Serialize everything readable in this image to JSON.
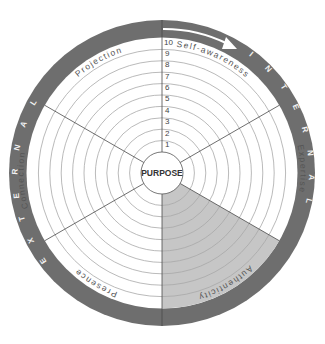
{
  "diagram": {
    "center_label": "PURPOSE",
    "scale": [
      "1",
      "2",
      "3",
      "4",
      "5",
      "6",
      "7",
      "8",
      "9",
      "10"
    ],
    "segments": [
      {
        "label": "Self-awareness",
        "shaded": false
      },
      {
        "label": "Expertise",
        "shaded": false
      },
      {
        "label": "Authenticity",
        "shaded": true
      },
      {
        "label": "Presence",
        "shaded": false
      },
      {
        "label": "Connection",
        "shaded": false
      },
      {
        "label": "Projection",
        "shaded": false
      }
    ],
    "outer_ring": {
      "internal": "INTERNAL",
      "external": "EXTERNAL"
    },
    "colors": {
      "ring": "#6e6e6e",
      "shaded_segment": "#c6c6c6",
      "background": "#ffffff"
    }
  }
}
